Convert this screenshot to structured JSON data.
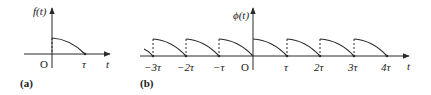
{
  "panel_a": {
    "caption": "(a)",
    "y_label": "f(t)",
    "x_label": "t",
    "origin_label": "O",
    "tick_labels": [
      "τ"
    ]
  },
  "panel_b": {
    "caption": "(b)",
    "y_label": "ϕ(t)",
    "x_label": "t",
    "origin_label": "O",
    "tick_labels": [
      "−3τ",
      "−2τ",
      "−τ",
      "τ",
      "2τ",
      "3τ",
      "4τ"
    ]
  },
  "colors": {
    "line": "#2a2a2a",
    "background": "#ffffff"
  }
}
